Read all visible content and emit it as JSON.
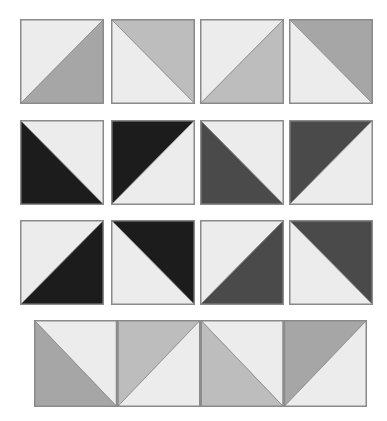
{
  "colors": {
    "light": "#ececec",
    "medium_light": "#bdbdbd",
    "medium": "#a6a6a6",
    "dark_gray": "#4a4a4a",
    "black": "#1c1c1c",
    "border": "#8a8a8a"
  },
  "grid": {
    "rows": [
      {
        "tiles": [
          {
            "diagonal": "bl-tr",
            "fill_upper": "#ececec",
            "fill_lower": "#a6a6a6"
          },
          {
            "diagonal": "tl-br",
            "fill_upper": "#bdbdbd",
            "fill_lower": "#ececec"
          },
          {
            "diagonal": "bl-tr",
            "fill_upper": "#ececec",
            "fill_lower": "#bdbdbd"
          },
          {
            "diagonal": "tl-br",
            "fill_upper": "#a6a6a6",
            "fill_lower": "#ececec"
          }
        ]
      },
      {
        "tiles": [
          {
            "diagonal": "tl-br",
            "fill_upper": "#ececec",
            "fill_lower": "#1c1c1c"
          },
          {
            "diagonal": "bl-tr",
            "fill_upper": "#1c1c1c",
            "fill_lower": "#ececec"
          },
          {
            "diagonal": "tl-br",
            "fill_upper": "#ececec",
            "fill_lower": "#4a4a4a"
          },
          {
            "diagonal": "bl-tr",
            "fill_upper": "#4a4a4a",
            "fill_lower": "#ececec"
          }
        ]
      },
      {
        "tiles": [
          {
            "diagonal": "bl-tr",
            "fill_upper": "#ececec",
            "fill_lower": "#1c1c1c"
          },
          {
            "diagonal": "tl-br",
            "fill_upper": "#1c1c1c",
            "fill_lower": "#ececec"
          },
          {
            "diagonal": "bl-tr",
            "fill_upper": "#ececec",
            "fill_lower": "#4a4a4a"
          },
          {
            "diagonal": "tl-br",
            "fill_upper": "#4a4a4a",
            "fill_lower": "#ececec"
          }
        ]
      }
    ]
  },
  "strip": {
    "segments": [
      {
        "diagonal": "tl-br",
        "fill_upper": "#ececec",
        "fill_lower": "#a6a6a6"
      },
      {
        "diagonal": "bl-tr",
        "fill_upper": "#bdbdbd",
        "fill_lower": "#ececec"
      },
      {
        "diagonal": "tl-br",
        "fill_upper": "#ececec",
        "fill_lower": "#bdbdbd"
      },
      {
        "diagonal": "bl-tr",
        "fill_upper": "#a6a6a6",
        "fill_lower": "#ececec"
      }
    ]
  }
}
